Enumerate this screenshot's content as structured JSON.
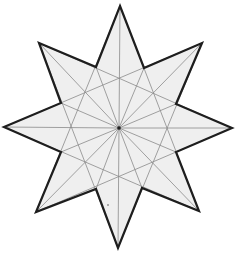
{
  "diagram": {
    "type": "eight-pointed-star",
    "width": 235,
    "height": 258,
    "center": [
      119,
      128
    ],
    "colors": {
      "background": "#ffffff",
      "fill": "#efefef",
      "outline": "#1e1e1e",
      "construction_lines": "#8a8a8a",
      "center_dot": "#222222"
    },
    "outer_points": [
      [
        120,
        6
      ],
      [
        202,
        43
      ],
      [
        232,
        128
      ],
      [
        199,
        211
      ],
      [
        118,
        248
      ],
      [
        36,
        212
      ],
      [
        4,
        127
      ],
      [
        39,
        43
      ]
    ],
    "inner_vertices": [
      [
        144,
        68
      ],
      [
        176,
        104
      ],
      [
        176,
        152
      ],
      [
        142,
        188
      ],
      [
        96,
        189
      ],
      [
        61,
        152
      ],
      [
        61,
        103
      ],
      [
        96,
        67
      ]
    ],
    "stray_dot": [
      108,
      205
    ]
  }
}
